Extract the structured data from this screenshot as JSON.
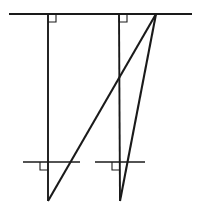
{
  "figure": {
    "title": "Geometric line diagram",
    "background_color": "#ffffff",
    "stroke_color": "#1a1a1a",
    "canvas": {
      "width": 199,
      "height": 214
    }
  },
  "chart_data": {
    "type": "line",
    "title": "Geometric line diagram",
    "xlabel": "",
    "ylabel": "",
    "xlim": [
      0,
      199
    ],
    "ylim": [
      0,
      214
    ],
    "grid": false,
    "legend": "none",
    "series": [
      {
        "name": "upper-horizontal-line",
        "role": "horizontal reference line (top)",
        "x": [
          9,
          192
        ],
        "y": [
          14,
          14
        ],
        "width": 2.2
      },
      {
        "name": "left-vertical-post",
        "role": "vertical perpendicular member (left)",
        "x": [
          48,
          48
        ],
        "y": [
          14,
          201
        ],
        "width": 1.9
      },
      {
        "name": "right-vertical-post",
        "role": "vertical perpendicular member (right)",
        "x": [
          119,
          120
        ],
        "y": [
          14,
          201
        ],
        "width": 1.9
      },
      {
        "name": "left-lower-horizontal-line",
        "role": "horizontal reference line (lower left)",
        "x": [
          23,
          80
        ],
        "y": [
          162,
          162
        ],
        "width": 1.5
      },
      {
        "name": "right-lower-horizontal-line",
        "role": "horizontal reference line (lower right)",
        "x": [
          95,
          145
        ],
        "y": [
          162,
          162
        ],
        "width": 1.5
      },
      {
        "name": "long-diagonal-brace",
        "role": "diagonal from lower-left foot to apex",
        "x": [
          48,
          156
        ],
        "y": [
          201,
          14
        ],
        "width": 2.1
      },
      {
        "name": "short-diagonal-brace",
        "role": "diagonal from lower-right foot to apex",
        "x": [
          120,
          156
        ],
        "y": [
          201,
          14
        ],
        "width": 2.1
      }
    ],
    "points": [
      {
        "name": "apex",
        "x": 156,
        "y": 14
      },
      {
        "name": "left-foot",
        "x": 48,
        "y": 201
      },
      {
        "name": "right-foot",
        "x": 120,
        "y": 201
      },
      {
        "name": "left-top-joint",
        "x": 48,
        "y": 14
      },
      {
        "name": "right-top-joint",
        "x": 119,
        "y": 14
      },
      {
        "name": "left-lower-joint",
        "x": 48,
        "y": 162
      },
      {
        "name": "right-lower-joint",
        "x": 120,
        "y": 162
      }
    ],
    "annotations": [
      {
        "name": "right-angle-marker-top-left",
        "x": 48,
        "y": 14,
        "size": 8,
        "orientation": "below-right"
      },
      {
        "name": "right-angle-marker-top-right",
        "x": 119,
        "y": 14,
        "size": 8,
        "orientation": "below-right"
      },
      {
        "name": "right-angle-marker-lower-left",
        "x": 48,
        "y": 162,
        "size": 8,
        "orientation": "below-left"
      },
      {
        "name": "right-angle-marker-lower-right",
        "x": 120,
        "y": 162,
        "size": 8,
        "orientation": "below-left"
      }
    ]
  }
}
